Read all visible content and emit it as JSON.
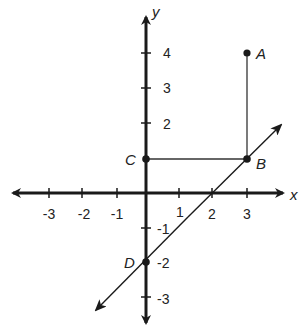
{
  "diagram": {
    "type": "coordinate-plane",
    "axes": {
      "x_label": "x",
      "y_label": "y",
      "x_ticks": [
        "-3",
        "-2",
        "-1",
        "1",
        "2",
        "3"
      ],
      "y_ticks": [
        "4",
        "3",
        "2",
        "-1",
        "-2",
        "-3"
      ]
    },
    "points": [
      {
        "name": "A",
        "x": 3,
        "y": 4
      },
      {
        "name": "B",
        "x": 3,
        "y": 1
      },
      {
        "name": "C",
        "x": 0,
        "y": 1
      },
      {
        "name": "D",
        "x": 0,
        "y": -2
      }
    ],
    "segments": [
      {
        "from": "A",
        "to": "B"
      },
      {
        "from": "C",
        "to": "B"
      }
    ],
    "lines": [
      {
        "through": [
          "D",
          "B"
        ],
        "slope": 1,
        "y_intercept": -2,
        "x_intercept": 2
      }
    ],
    "labels": {
      "x_m3": "-3",
      "x_m2": "-2",
      "x_m1": "-1",
      "x_1": "1",
      "x_2": "2",
      "x_3": "3",
      "y_4": "4",
      "y_3": "3",
      "y_2": "2",
      "y_m1": "-1",
      "y_m2": "-2",
      "y_m3": "-3",
      "A": "A",
      "B": "B",
      "C": "C",
      "D": "D",
      "x_axis": "x",
      "y_axis": "y"
    }
  }
}
